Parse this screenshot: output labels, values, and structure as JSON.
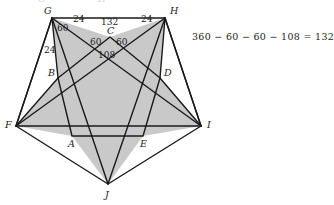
{
  "figure": {
    "fill_color": "#c9c9c9",
    "stroke_color": "#1a1a1a",
    "background": "#ffffff",
    "outer_pentagon": {
      "name": "outer-pentagon",
      "vertices": [
        {
          "id": "G",
          "label": "G",
          "x": 52,
          "y": 18,
          "label_x": 44,
          "label_y": 14
        },
        {
          "id": "H",
          "label": "H",
          "x": 165,
          "y": 18,
          "label_x": 170,
          "label_y": 14
        },
        {
          "id": "I",
          "label": "I",
          "x": 201,
          "y": 126,
          "label_x": 207,
          "label_y": 128
        },
        {
          "id": "J",
          "label": "J",
          "x": 108,
          "y": 184,
          "label_x": 105,
          "label_y": 198
        },
        {
          "id": "F",
          "label": "F",
          "x": 16,
          "y": 126,
          "label_x": 5,
          "label_y": 128
        }
      ]
    },
    "inner_pentagon": {
      "name": "inner-pentagon",
      "vertices": [
        {
          "id": "C",
          "label": "C",
          "x": 110,
          "y": 37,
          "label_x": 107,
          "label_y": 34
        },
        {
          "id": "D",
          "label": "D",
          "x": 160,
          "y": 78,
          "label_x": 164,
          "label_y": 76
        },
        {
          "id": "E",
          "label": "E",
          "x": 143,
          "y": 136,
          "label_x": 140,
          "label_y": 147
        },
        {
          "id": "A",
          "label": "A",
          "x": 72,
          "y": 136,
          "label_x": 68,
          "label_y": 147
        },
        {
          "id": "B",
          "label": "B",
          "x": 58,
          "y": 78,
          "label_x": 48,
          "label_y": 76
        }
      ]
    },
    "angle_labels": [
      {
        "name": "angle-24-top-left",
        "text": "24",
        "x": 73,
        "y": 22
      },
      {
        "name": "angle-132-apex",
        "text": "132",
        "x": 101,
        "y": 25
      },
      {
        "name": "angle-24-top-right",
        "text": "24",
        "x": 141,
        "y": 22
      },
      {
        "name": "angle-60-at-g",
        "text": "60",
        "x": 57,
        "y": 31
      },
      {
        "name": "angle-24-left-side",
        "text": "24",
        "x": 44,
        "y": 53
      },
      {
        "name": "angle-60-left-of-c",
        "text": "60",
        "x": 90,
        "y": 45
      },
      {
        "name": "angle-60-right-of-c",
        "text": "60",
        "x": 116,
        "y": 45
      },
      {
        "name": "angle-108-below-c",
        "text": "108",
        "x": 98,
        "y": 58
      }
    ],
    "equation": {
      "name": "angle-sum-equation",
      "text": "360 − 60 − 60 − 108 = 132",
      "x": 192,
      "y": 38
    },
    "top_ghost_marks": [
      {
        "name": "ghost-glyph-left",
        "text": "G",
        "x": 38
      },
      {
        "name": "ghost-glyph-right",
        "text": "H",
        "x": 98
      }
    ]
  }
}
